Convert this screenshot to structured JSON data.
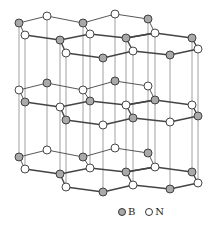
{
  "figure": {
    "layer_spacing": 67,
    "colors": {
      "B": "#a9a9a9",
      "N": "#ffffff",
      "stroke": "#333333",
      "bond": "#444444",
      "vertical": "#888888"
    },
    "top_layer_atoms": [
      {
        "id": "a1",
        "x": 19,
        "y": 23,
        "el": "B"
      },
      {
        "id": "a2",
        "x": 47,
        "y": 16,
        "el": "N"
      },
      {
        "id": "a3",
        "x": 83,
        "y": 23,
        "el": "B"
      },
      {
        "id": "a4",
        "x": 115,
        "y": 14,
        "el": "N"
      },
      {
        "id": "a5",
        "x": 148,
        "y": 19,
        "el": "B"
      },
      {
        "id": "a6",
        "x": 25,
        "y": 35,
        "el": "N"
      },
      {
        "id": "a7",
        "x": 60,
        "y": 40,
        "el": "B"
      },
      {
        "id": "a8",
        "x": 90,
        "y": 34,
        "el": "N"
      },
      {
        "id": "a9",
        "x": 126,
        "y": 38,
        "el": "B"
      },
      {
        "id": "a10",
        "x": 155,
        "y": 33,
        "el": "N"
      },
      {
        "id": "a11",
        "x": 192,
        "y": 38,
        "el": "B"
      },
      {
        "id": "a12",
        "x": 66,
        "y": 53,
        "el": "N"
      },
      {
        "id": "a13",
        "x": 103,
        "y": 58,
        "el": "B"
      },
      {
        "id": "a14",
        "x": 133,
        "y": 51,
        "el": "N"
      },
      {
        "id": "a15",
        "x": 170,
        "y": 55,
        "el": "B"
      },
      {
        "id": "a16",
        "x": 198,
        "y": 49,
        "el": "N"
      }
    ],
    "bonds": [
      [
        "a1",
        "a2"
      ],
      [
        "a2",
        "a3"
      ],
      [
        "a3",
        "a4"
      ],
      [
        "a4",
        "a5"
      ],
      [
        "a1",
        "a6"
      ],
      [
        "a6",
        "a7"
      ],
      [
        "a7",
        "a8"
      ],
      [
        "a8",
        "a3"
      ],
      [
        "a7",
        "a12"
      ],
      [
        "a12",
        "a13"
      ],
      [
        "a13",
        "a14"
      ],
      [
        "a14",
        "a9"
      ],
      [
        "a8",
        "a9"
      ],
      [
        "a9",
        "a10"
      ],
      [
        "a10",
        "a5"
      ],
      [
        "a9",
        "a10"
      ],
      [
        "a10",
        "a11"
      ],
      [
        "a14",
        "a15"
      ],
      [
        "a15",
        "a16"
      ],
      [
        "a16",
        "a11"
      ]
    ]
  },
  "legend": {
    "items": [
      {
        "symbol": "B",
        "label": "B",
        "fill": "#a9a9a9"
      },
      {
        "symbol": "N",
        "label": "N",
        "fill": "#ffffff"
      }
    ]
  }
}
